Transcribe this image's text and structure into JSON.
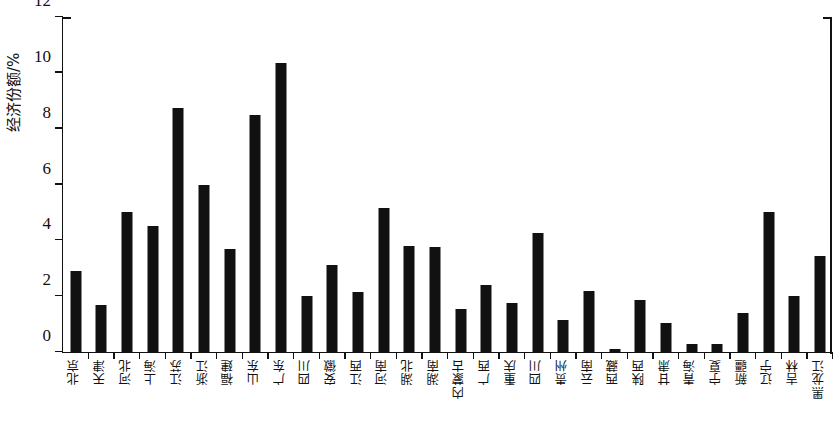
{
  "chart_data": {
    "type": "bar",
    "title": "",
    "xlabel": "",
    "ylabel": "经济份额/%",
    "ylim": [
      0,
      12
    ],
    "ytick_values": [
      0,
      2,
      4,
      6,
      8,
      10,
      12
    ],
    "ytick_labels": [
      "0",
      "2",
      "4",
      "6",
      "8",
      "10",
      "12"
    ],
    "grid": false,
    "legend": false,
    "bar_color": "#111111",
    "categories": [
      "北京",
      "天津",
      "河北",
      "上海",
      "江苏",
      "浙江",
      "福建",
      "山东",
      "广东",
      "四川",
      "安徽",
      "江西",
      "河南",
      "湖北",
      "湖南",
      "内蒙古",
      "广西",
      "重庆",
      "四川",
      "贵州",
      "云南",
      "西藏",
      "陕西",
      "甘肃",
      "青海",
      "宁夏",
      "新疆",
      "辽宁",
      "吉林",
      "黑龙江"
    ],
    "values": [
      2.9,
      1.7,
      5.0,
      4.5,
      8.75,
      6.0,
      3.7,
      8.5,
      10.35,
      2.0,
      3.1,
      2.15,
      5.15,
      3.8,
      3.75,
      1.55,
      2.4,
      1.75,
      4.25,
      1.15,
      2.2,
      0.1,
      1.85,
      1.05,
      0.3,
      0.3,
      1.4,
      5.0,
      2.0,
      3.45
    ]
  }
}
